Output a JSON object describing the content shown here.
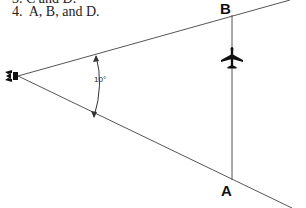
{
  "answer_options": [
    {
      "number": "3.",
      "text": "C and D."
    },
    {
      "number": "4.",
      "text": "A, B, and D."
    }
  ],
  "diagram": {
    "source_icon": "radar-antenna-icon",
    "angle_label": "10°",
    "point_labels": {
      "upper": "B",
      "lower": "A"
    },
    "aircraft_icon": "airplane-icon",
    "colors": {
      "lines": "#555555",
      "text": "#111111"
    }
  }
}
